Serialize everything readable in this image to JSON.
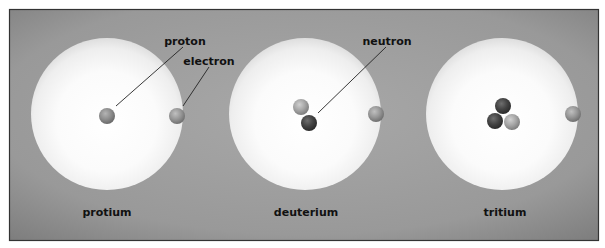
{
  "diagram": {
    "type": "isotope-comparison",
    "colors": {
      "panel_bg": "#9c9c9c",
      "panel_edge": "#7e7e7e",
      "panel_border": "#333333",
      "cloud_center": "#ffffff",
      "cloud_edge": "#e8e8e8",
      "proton": "#8f8f8f",
      "neutron": "#4a4a4a",
      "electron": "#989898",
      "label": "#111111",
      "leader_line": "#222222"
    },
    "callouts": {
      "proton": "proton",
      "electron": "electron",
      "neutron": "neutron"
    },
    "isotopes": [
      {
        "name": "protium",
        "protons": 1,
        "neutrons": 0,
        "electrons": 1
      },
      {
        "name": "deuterium",
        "protons": 1,
        "neutrons": 1,
        "electrons": 1
      },
      {
        "name": "tritium",
        "protons": 1,
        "neutrons": 2,
        "electrons": 1
      }
    ]
  }
}
